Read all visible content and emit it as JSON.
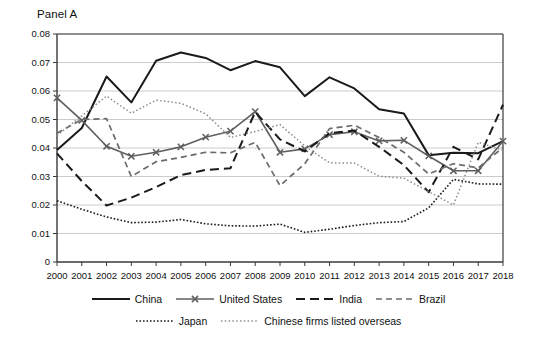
{
  "panel": {
    "title": "Panel A"
  },
  "legend": {
    "rows": [
      [
        {
          "label": "China",
          "key": "china"
        },
        {
          "label": "United States",
          "key": "united_states"
        },
        {
          "label": "India",
          "key": "india"
        },
        {
          "label": "Brazil",
          "key": "brazil"
        }
      ],
      [
        {
          "label": "Japan",
          "key": "japan"
        },
        {
          "label": "Chinese firms listed overseas",
          "key": "chinese_firms_overseas"
        }
      ]
    ]
  },
  "chart_data": {
    "type": "line",
    "title": "Panel A",
    "xlabel": "",
    "ylabel": "",
    "xlim": [
      2000,
      2018
    ],
    "ylim": [
      0,
      0.08
    ],
    "grid": true,
    "legend_position": "bottom",
    "yticks": [
      "0",
      "0.01",
      "0.02",
      "0.03",
      "0.04",
      "0.05",
      "0.06",
      "0.07",
      "0.08"
    ],
    "ytick_values": [
      0,
      0.01,
      0.02,
      0.03,
      0.04,
      0.05,
      0.06,
      0.07,
      0.08
    ],
    "categories": [
      2000,
      2001,
      2002,
      2003,
      2004,
      2005,
      2006,
      2007,
      2008,
      2009,
      2010,
      2011,
      2012,
      2013,
      2014,
      2015,
      2016,
      2017,
      2018
    ],
    "xtick_labels": [
      "2000",
      "2001",
      "2002",
      "2003",
      "2004",
      "2005",
      "2006",
      "2007",
      "2008",
      "2009",
      "2010",
      "2011",
      "2012",
      "2013",
      "2014",
      "2015",
      "2016",
      "2017",
      "2018"
    ],
    "series": [
      {
        "name": "China",
        "key": "china",
        "style": "solid",
        "color": "#1a1a1a",
        "width": 2.0,
        "marker": "none",
        "values": [
          0.0393,
          0.047,
          0.0651,
          0.056,
          0.0706,
          0.0735,
          0.0716,
          0.0673,
          0.0705,
          0.0683,
          0.0582,
          0.0648,
          0.0609,
          0.0536,
          0.0521,
          0.0375,
          0.0383,
          0.0382,
          0.0424
        ]
      },
      {
        "name": "United States",
        "key": "united_states",
        "style": "solid",
        "color": "#5f5f5f",
        "width": 1.6,
        "marker": "x",
        "values": [
          0.0576,
          0.0497,
          0.0406,
          0.0371,
          0.0385,
          0.0404,
          0.0438,
          0.0459,
          0.0528,
          0.0385,
          0.0397,
          0.0447,
          0.0457,
          0.0425,
          0.0427,
          0.0372,
          0.032,
          0.032,
          0.0424
        ]
      },
      {
        "name": "India",
        "key": "india",
        "style": "dash-long",
        "color": "#1a1a1a",
        "width": 2.0,
        "marker": "none",
        "values": [
          0.0381,
          0.0284,
          0.0198,
          0.0226,
          0.0263,
          0.0305,
          0.0323,
          0.0329,
          0.0527,
          0.043,
          0.0388,
          0.0452,
          0.0461,
          0.0404,
          0.034,
          0.0245,
          0.0404,
          0.036,
          0.0552
        ]
      },
      {
        "name": "Brazil",
        "key": "brazil",
        "style": "dash-short",
        "color": "#6b6b6b",
        "width": 1.7,
        "marker": "none",
        "values": [
          0.0452,
          0.05,
          0.0503,
          0.03,
          0.0352,
          0.0367,
          0.0385,
          0.0383,
          0.042,
          0.0268,
          0.0345,
          0.0468,
          0.048,
          0.0437,
          0.0385,
          0.0309,
          0.0345,
          0.033,
          0.0402
        ]
      },
      {
        "name": "Japan",
        "key": "japan",
        "style": "dot-fine",
        "color": "#1a1a1a",
        "width": 1.6,
        "marker": "none",
        "values": [
          0.0215,
          0.0185,
          0.0158,
          0.0138,
          0.014,
          0.0149,
          0.0134,
          0.0127,
          0.0126,
          0.0133,
          0.0104,
          0.0115,
          0.0128,
          0.0138,
          0.0142,
          0.019,
          0.029,
          0.0274,
          0.0273
        ]
      },
      {
        "name": "Chinese firms listed overseas",
        "key": "chinese_firms_overseas",
        "style": "dot-light",
        "color": "#8c8c8c",
        "width": 1.5,
        "marker": "none",
        "values": [
          0.0444,
          0.0513,
          0.0582,
          0.0522,
          0.0568,
          0.0557,
          0.052,
          0.0437,
          0.0458,
          0.0482,
          0.0407,
          0.0348,
          0.0347,
          0.0301,
          0.0294,
          0.0247,
          0.02,
          0.042,
          0.0392
        ]
      }
    ]
  },
  "colors": {
    "axis": "#3a3a3a",
    "grid": "#bfbfbf",
    "text": "#111111",
    "background": "#ffffff"
  }
}
